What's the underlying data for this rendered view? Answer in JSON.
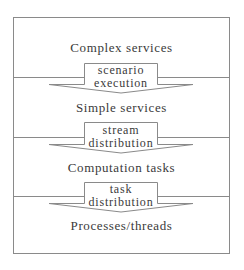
{
  "diagram": {
    "layers": [
      {
        "label": "Complex services"
      },
      {
        "label": "Simple services"
      },
      {
        "label": "Computation tasks"
      },
      {
        "label": "Processes/threads"
      }
    ],
    "transitions": [
      {
        "line1": "scenario",
        "line2": "execution"
      },
      {
        "line1": "stream",
        "line2": "distribution"
      },
      {
        "line1": "task",
        "line2": "distribution"
      }
    ],
    "colors": {
      "stroke": "#8a8a8a",
      "text": "#3a3a3a",
      "background": "#ffffff"
    }
  }
}
